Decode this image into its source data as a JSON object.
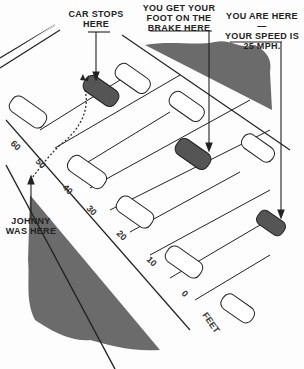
{
  "labels": {
    "car_stops": "CAR STOPS\nHERE",
    "foot_on_brake": "YOU GET YOUR\nFOOT ON THE\nBRAKE HERE",
    "you_are_here": "YOU ARE HERE—\nYOUR SPEED IS\n25 MPH.",
    "johnny": "JOHNNY\nWAS HERE"
  },
  "scale": {
    "unit": "FEET",
    "ticks": [
      "60",
      "50",
      "40",
      "30",
      "20",
      "10",
      "0"
    ]
  },
  "colors": {
    "ink": "#222222",
    "foliage": "#6b6b6b",
    "dark_car": "#555555"
  }
}
